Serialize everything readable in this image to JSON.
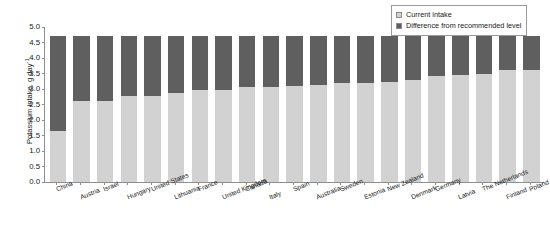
{
  "chart_data": {
    "type": "bar",
    "subtype": "stacked-bar",
    "title": "",
    "xlabel": "",
    "ylabel": "Potassium intake, g day",
    "ylabel_exponent": "-1",
    "ylim": [
      0.0,
      5.0
    ],
    "ytick_labels": [
      "5.0",
      "4.5",
      "4.0",
      "3.5",
      "3.0",
      "2.5",
      "2.0",
      "1.5",
      "1.0",
      "0.5",
      "0.0"
    ],
    "ytick_values": [
      5.0,
      4.5,
      4.0,
      3.5,
      3.0,
      2.5,
      2.0,
      1.5,
      1.0,
      0.5,
      0.0
    ],
    "grid": false,
    "legend_position": "top-right",
    "categories": [
      "China",
      "Austria",
      "Israel",
      "Hungary",
      "United States",
      "Lithuania",
      "France",
      "United Kingdom",
      "Canada",
      "Italy",
      "Spain",
      "Australia",
      "Sweden",
      "Estonia",
      "New Zealand",
      "Denmark",
      "Germany",
      "Latvia",
      "The Netherlands",
      "Finland",
      "Poland"
    ],
    "series": [
      {
        "name": "Current intake",
        "color": "#d2d2d2",
        "values": [
          1.65,
          2.6,
          2.6,
          2.78,
          2.78,
          2.86,
          2.98,
          2.98,
          3.05,
          3.05,
          3.1,
          3.12,
          3.18,
          3.2,
          3.22,
          3.3,
          3.42,
          3.45,
          3.5,
          3.6,
          3.62
        ]
      },
      {
        "name": "Difference from recommended level",
        "color": "#5f5f5f",
        "values": [
          3.05,
          2.1,
          2.1,
          1.92,
          1.92,
          1.84,
          1.72,
          1.72,
          1.65,
          1.65,
          1.6,
          1.58,
          1.52,
          1.5,
          1.48,
          1.4,
          1.28,
          1.25,
          1.2,
          1.1,
          1.08
        ]
      }
    ],
    "totals": [
      4.7,
      4.7,
      4.7,
      4.7,
      4.7,
      4.7,
      4.7,
      4.7,
      4.7,
      4.7,
      4.7,
      4.7,
      4.7,
      4.7,
      4.7,
      4.7,
      4.7,
      4.7,
      4.7,
      4.7,
      4.7
    ]
  },
  "legend": {
    "items": [
      {
        "label": "Current intake",
        "color": "#d2d2d2"
      },
      {
        "label": "Difference from recommended level",
        "color": "#5f5f5f"
      }
    ]
  }
}
